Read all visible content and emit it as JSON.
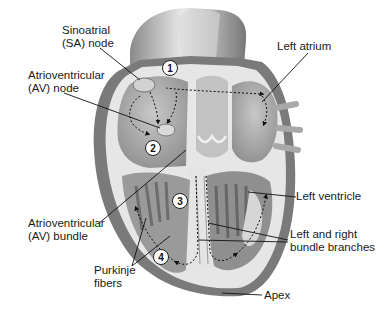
{
  "diagram": {
    "labels": {
      "sa_node": [
        "Sinoatrial",
        "(SA) node"
      ],
      "av_node": [
        "Atrioventricular",
        "(AV) node"
      ],
      "left_atrium": [
        "Left atrium"
      ],
      "left_ventricle": [
        "Left ventricle"
      ],
      "av_bundle": [
        "Atrioventricular",
        "(AV) bundle"
      ],
      "bundle_branches": [
        "Left and right",
        "bundle branches"
      ],
      "purkinje": [
        "Purkinje",
        "fibers"
      ],
      "apex": [
        "Apex"
      ]
    },
    "steps": [
      {
        "number": "1",
        "x": 170,
        "y": 68
      },
      {
        "number": "2",
        "x": 153,
        "y": 148
      },
      {
        "number": "3",
        "x": 180,
        "y": 201
      },
      {
        "number": "4",
        "x": 161,
        "y": 257
      }
    ],
    "colors": {
      "outer_wall": "#7a7a7a",
      "muscle": "#9a9a9a",
      "chamber": "#b5b5b5",
      "inner_lining": "#e6e6e6",
      "text": "#1a1a1a"
    }
  }
}
